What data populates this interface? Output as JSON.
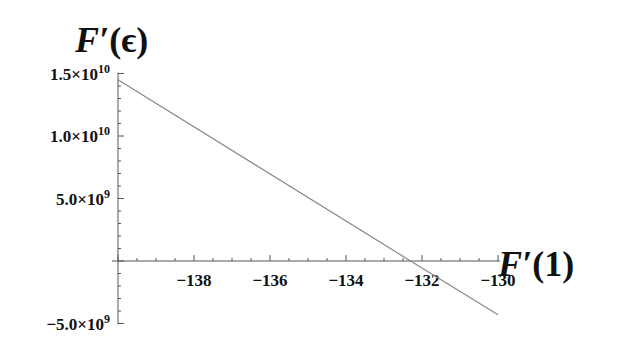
{
  "chart_data": {
    "type": "line",
    "title": "",
    "xlabel": "F′(1)",
    "ylabel": "F′(ϵ)",
    "xlim": [
      -140,
      -130
    ],
    "ylim": [
      -5000000000.0,
      15000000000.0
    ],
    "grid": false,
    "legend": null,
    "x_ticks": [
      -138,
      -136,
      -134,
      -132,
      -130
    ],
    "x_tick_labels": [
      "−138",
      "−136",
      "−134",
      "−132",
      "−130"
    ],
    "y_ticks": [
      -5000000000.0,
      5000000000.0,
      10000000000.0,
      15000000000.0
    ],
    "y_tick_labels": [
      {
        "mantissa": "−5.0",
        "exp": "9"
      },
      {
        "mantissa": "5.0",
        "exp": "9"
      },
      {
        "mantissa": "1.0",
        "exp": "10"
      },
      {
        "mantissa": "1.5",
        "exp": "10"
      }
    ],
    "series": [
      {
        "name": "F′(ϵ) vs F′(1)",
        "color": "#888888",
        "x": [
          -140.0,
          -132.3,
          -130.0
        ],
        "y": [
          14500000000.0,
          0.0,
          -4300000000.0
        ]
      }
    ]
  },
  "labels": {
    "ylabel_main": "F′",
    "ylabel_arg": "(ϵ)",
    "xlabel_main": "F′",
    "xlabel_arg": "(1)",
    "times": "×",
    "ten": "10"
  }
}
